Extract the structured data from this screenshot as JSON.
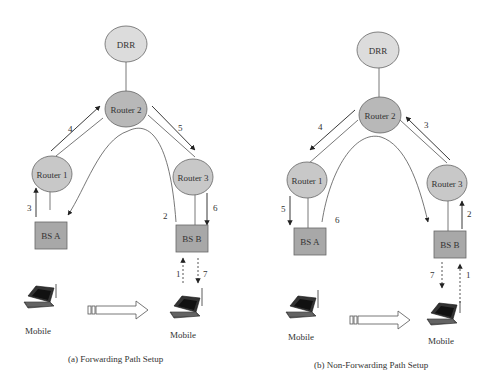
{
  "colors": {
    "drr_fill": "#dcdcdc",
    "router_fill": "#c4c4c4",
    "router2_fill": "#b0b0b0",
    "bs_fill": "#a8a8a8",
    "line": "#444444"
  },
  "panel_a": {
    "caption": "(a)  Forwarding Path Setup",
    "nodes": {
      "drr": "DRR",
      "router1": "Router 1",
      "router2": "Router 2",
      "router3": "Router 3",
      "bsa": "BS A",
      "bsb": "BS B"
    },
    "mobile_left": "Mobile",
    "mobile_right": "Mobile",
    "step_labels": {
      "s1": "1",
      "s2": "2",
      "s3": "3",
      "s4": "4",
      "s5": "5",
      "s6": "6",
      "s7": "7"
    }
  },
  "panel_b": {
    "caption": "(b) Non-Forwarding Path Setup",
    "nodes": {
      "drr": "DRR",
      "router1": "Router 1",
      "router2": "Router 2",
      "router3": "Router 3",
      "bsa": "BS A",
      "bsb": "BS B"
    },
    "mobile_left": "Mobile",
    "mobile_right": "Mobile",
    "step_labels": {
      "s1": "1",
      "s2": "2",
      "s3": "3",
      "s4": "4",
      "s5": "5",
      "s6": "6",
      "s7": "7"
    }
  }
}
